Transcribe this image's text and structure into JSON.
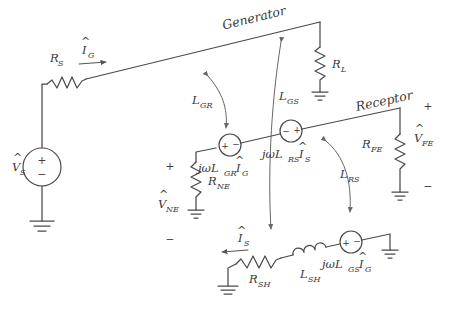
{
  "figure": {
    "type": "circuit-schematic",
    "background_color": "#ffffff",
    "line_color": "#4a4a4a",
    "annotation_color": "#666666"
  },
  "labels": {
    "generator": "Generator",
    "receptor": "Receptor"
  },
  "sources": {
    "vs": {
      "symbol": "V",
      "hat": "^",
      "subscript": "S",
      "plus": "+",
      "minus": "−"
    },
    "v_lgr_ig": {
      "expr": "jωL",
      "sub1": "GR",
      "expr2": "I",
      "sub2": "G",
      "hat": "^",
      "plus": "+",
      "minus": "−",
      "polarity": "plus-left"
    },
    "v_lrs_is": {
      "expr": "jωL",
      "sub1": "RS",
      "expr2": "I",
      "sub2": "S",
      "hat": "^",
      "plus": "+",
      "minus": "−",
      "polarity": "minus-left"
    },
    "v_lgs_ig": {
      "expr": "jωL",
      "sub1": "GS",
      "expr2": "I",
      "sub2": "G",
      "hat": "^",
      "plus": "+",
      "minus": "−",
      "polarity": "plus-left"
    }
  },
  "resistors": {
    "rs": {
      "symbol": "R",
      "subscript": "S"
    },
    "rl": {
      "symbol": "R",
      "subscript": "L"
    },
    "rne": {
      "symbol": "R",
      "subscript": "NE"
    },
    "rfe": {
      "symbol": "R",
      "subscript": "FE"
    },
    "rsh": {
      "symbol": "R",
      "subscript": "SH"
    }
  },
  "inductors": {
    "lsh": {
      "symbol": "L",
      "subscript": "SH"
    }
  },
  "voltages": {
    "vne": {
      "symbol": "V",
      "hat": "^",
      "subscript": "NE",
      "plus": "+",
      "minus": "−"
    },
    "vfe": {
      "symbol": "V",
      "hat": "^",
      "subscript": "FE",
      "plus": "+",
      "minus": "−"
    }
  },
  "currents": {
    "ig": {
      "symbol": "I",
      "hat": "^",
      "subscript": "G",
      "direction": "right"
    },
    "is": {
      "symbol": "I",
      "hat": "^",
      "subscript": "S",
      "direction": "left"
    }
  },
  "couplings": {
    "lgr": {
      "symbol": "L",
      "subscript": "GR"
    },
    "lgs": {
      "symbol": "L",
      "subscript": "GS"
    },
    "lrs": {
      "symbol": "L",
      "subscript": "RS"
    }
  }
}
